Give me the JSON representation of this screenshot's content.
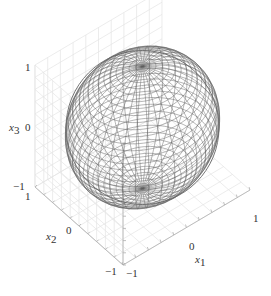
{
  "chart_data": {
    "type": "surface-wireframe-3d",
    "title": "",
    "surface": {
      "shape": "sphere",
      "center": [
        0,
        0,
        0
      ],
      "radius": 1,
      "mesh_color": "#555555"
    },
    "axes": {
      "x1": {
        "label": "x1",
        "label_main": "x",
        "label_sub": "1",
        "ticks": [
          "-1",
          "0",
          "1"
        ],
        "range": [
          -1,
          1
        ]
      },
      "x2": {
        "label": "x2",
        "label_main": "x",
        "label_sub": "2",
        "ticks": [
          "-1",
          "0",
          "1"
        ],
        "range": [
          -1,
          1
        ]
      },
      "x3": {
        "label": "x3",
        "label_main": "x",
        "label_sub": "3",
        "ticks": [
          "-1",
          "0",
          "1"
        ],
        "range": [
          -1,
          1
        ]
      }
    },
    "grid": true,
    "legend": null,
    "view": "isometric-like, x1 right-front, x2 left-front, x3 up"
  },
  "colors": {
    "mesh": "#5a5a5a",
    "grid": "#e2e2e2",
    "axis": "#aaaaaa",
    "text": "#333333"
  }
}
